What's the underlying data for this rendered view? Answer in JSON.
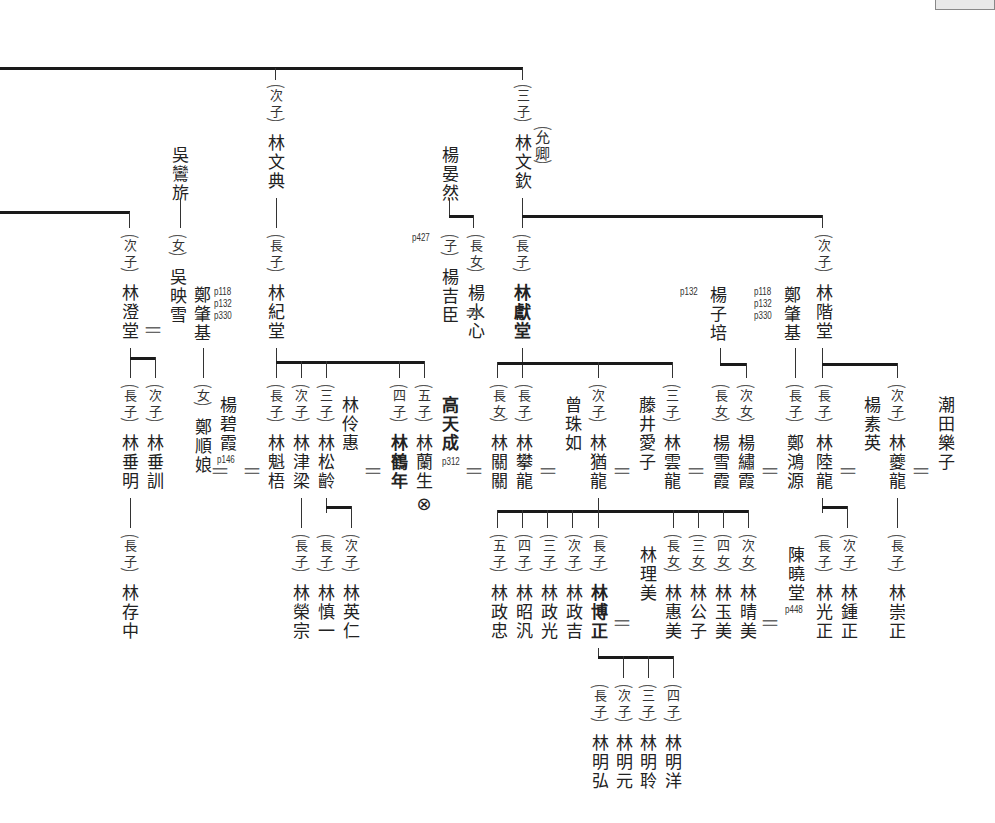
{
  "chart_title": "",
  "persons": [
    {
      "id": "wenjian",
      "rel": "次子",
      "name": "林文典"
    },
    {
      "id": "wenqin",
      "rel": "三子",
      "name": "林文欽",
      "alias": "允卿"
    },
    {
      "id": "wu_luanqi",
      "rel": "",
      "name": "吳鸞旂"
    },
    {
      "id": "yang_yanran",
      "rel": "",
      "name": "楊晏然"
    },
    {
      "id": "chengtang",
      "rel": "次子",
      "name": "林澄堂"
    },
    {
      "id": "wu_yingxue",
      "rel": "女",
      "name": "吳映雪"
    },
    {
      "id": "zheng_zhaoji",
      "rel": "",
      "name": "鄭肇基",
      "refs": [
        "p118",
        "p132",
        "p330"
      ]
    },
    {
      "id": "jitang",
      "rel": "長子",
      "name": "林紀堂"
    },
    {
      "id": "yang_jichen",
      "rel": "子",
      "name": "楊吉臣",
      "refs": [
        "p427"
      ]
    },
    {
      "id": "yang_shuixin",
      "rel": "長女",
      "name": "楊水心"
    },
    {
      "id": "xiantang",
      "rel": "長子",
      "name": "林獻堂"
    },
    {
      "id": "yang_zipei",
      "rel": "",
      "name": "楊子培",
      "refs": [
        "p132"
      ]
    },
    {
      "id": "zheng_zhaoji2",
      "rel": "",
      "name": "鄭肇基",
      "refs": [
        "p118",
        "p132",
        "p330"
      ]
    },
    {
      "id": "jietang",
      "rel": "次子",
      "name": "林階堂"
    },
    {
      "id": "chuiming",
      "rel": "長子",
      "name": "林垂明"
    },
    {
      "id": "chuixun",
      "rel": "次子",
      "name": "林垂訓"
    },
    {
      "id": "zheng_shunniang",
      "rel": "女",
      "name": "鄭順娘"
    },
    {
      "id": "yang_bixia",
      "rel": "",
      "name": "楊碧霞",
      "refs": [
        "p146"
      ]
    },
    {
      "id": "kuiwu",
      "rel": "長子",
      "name": "林魁梧"
    },
    {
      "id": "jinliang",
      "rel": "次子",
      "name": "林津梁"
    },
    {
      "id": "songling",
      "rel": "三子",
      "name": "林松齡"
    },
    {
      "id": "linghui",
      "rel": "",
      "name": "林伶惠"
    },
    {
      "id": "henian",
      "rel": "四子",
      "name": "林鶴年"
    },
    {
      "id": "lansheng",
      "rel": "五子",
      "name": "林蘭生",
      "mark": "⊗"
    },
    {
      "id": "gao_tiancheng",
      "rel": "",
      "name": "高天成",
      "refs": [
        "p312"
      ]
    },
    {
      "id": "guanguan",
      "rel": "長女",
      "name": "林關關"
    },
    {
      "id": "panlong",
      "rel": "長子",
      "name": "林攀龍"
    },
    {
      "id": "zeng_zhuru",
      "rel": "",
      "name": "曾珠如"
    },
    {
      "id": "youlong",
      "rel": "次子",
      "name": "林猶龍"
    },
    {
      "id": "fujii_aiko",
      "rel": "",
      "name": "藤井愛子"
    },
    {
      "id": "yunlong",
      "rel": "三子",
      "name": "林雲龍"
    },
    {
      "id": "yang_xuexia",
      "rel": "長女",
      "name": "楊雪霞"
    },
    {
      "id": "yang_xiuxia",
      "rel": "次女",
      "name": "楊繡霞"
    },
    {
      "id": "zheng_hongyuan",
      "rel": "長子",
      "name": "鄭鴻源"
    },
    {
      "id": "lulong",
      "rel": "長子",
      "name": "林陸龍"
    },
    {
      "id": "yang_suying",
      "rel": "",
      "name": "楊素英"
    },
    {
      "id": "kuilong",
      "rel": "次子",
      "name": "林夔龍"
    },
    {
      "id": "shiota_rakuko",
      "rel": "",
      "name": "潮田樂子"
    },
    {
      "id": "cunzhong",
      "rel": "長子",
      "name": "林存中"
    },
    {
      "id": "rongzong",
      "rel": "長子",
      "name": "林榮宗"
    },
    {
      "id": "shenyi",
      "rel": "長子",
      "name": "林慎一"
    },
    {
      "id": "yingren",
      "rel": "次子",
      "name": "林英仁"
    },
    {
      "id": "zhengzhong",
      "rel": "五子",
      "name": "林政忠"
    },
    {
      "id": "zhaofan",
      "rel": "四子",
      "name": "林昭汎"
    },
    {
      "id": "zhengguang",
      "rel": "三子",
      "name": "林政光"
    },
    {
      "id": "zhengji",
      "rel": "次子",
      "name": "林政吉"
    },
    {
      "id": "bozheng",
      "rel": "長子",
      "name": "林博正"
    },
    {
      "id": "limei",
      "rel": "",
      "name": "林理美"
    },
    {
      "id": "huimei",
      "rel": "長女",
      "name": "林惠美"
    },
    {
      "id": "gongzi",
      "rel": "三女",
      "name": "林公子"
    },
    {
      "id": "yumei",
      "rel": "四女",
      "name": "林玉美"
    },
    {
      "id": "qingmei",
      "rel": "次女",
      "name": "林晴美"
    },
    {
      "id": "chen_xiaotang",
      "rel": "",
      "name": "陳曉堂",
      "refs": [
        "p448"
      ]
    },
    {
      "id": "guangzheng",
      "rel": "長子",
      "name": "林光正"
    },
    {
      "id": "zhongzheng",
      "rel": "次子",
      "name": "林鍾正"
    },
    {
      "id": "chongzheng",
      "rel": "長子",
      "name": "林崇正"
    },
    {
      "id": "minghong",
      "rel": "長子",
      "name": "林明弘"
    },
    {
      "id": "mingyuan",
      "rel": "次子",
      "name": "林明元"
    },
    {
      "id": "mingling",
      "rel": "三子",
      "name": "林明聆"
    },
    {
      "id": "mingyang",
      "rel": "四子",
      "name": "林明洋"
    }
  ],
  "labels": {
    "eq": "＝",
    "p118": "p118",
    "p132": "p132",
    "p330": "p330",
    "p427": "p427",
    "p146": "p146",
    "p312": "p312",
    "p448": "p448",
    "mark": "⊗",
    "alias": "允卿"
  }
}
